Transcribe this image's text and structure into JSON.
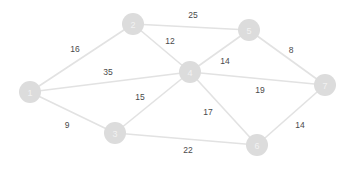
{
  "diagram": {
    "background_color": "#ffffff",
    "node_color": "#dcdcdc",
    "node_label_color": "#f2f2f2",
    "edge_color": "#e2e2e2",
    "weight_label_color": "#4a4a4a",
    "node_radius": 11
  },
  "chart_data": {
    "type": "diagram",
    "nodes": [
      {
        "id": "1",
        "label": "1",
        "x": 30,
        "y": 92
      },
      {
        "id": "2",
        "label": "2",
        "x": 133,
        "y": 24
      },
      {
        "id": "3",
        "label": "3",
        "x": 115,
        "y": 133
      },
      {
        "id": "4",
        "label": "4",
        "x": 190,
        "y": 72
      },
      {
        "id": "5",
        "label": "5",
        "x": 249,
        "y": 30
      },
      {
        "id": "6",
        "label": "6",
        "x": 257,
        "y": 145
      },
      {
        "id": "7",
        "label": "7",
        "x": 325,
        "y": 85
      }
    ],
    "edges": [
      {
        "source": "1",
        "target": "2",
        "weight": 16,
        "label_x": 75,
        "label_y": 49
      },
      {
        "source": "1",
        "target": "4",
        "weight": 35,
        "label_x": 108,
        "label_y": 72
      },
      {
        "source": "1",
        "target": "3",
        "weight": 9,
        "label_x": 67,
        "label_y": 125
      },
      {
        "source": "2",
        "target": "5",
        "weight": 25,
        "label_x": 193,
        "label_y": 15
      },
      {
        "source": "2",
        "target": "4",
        "weight": 12,
        "label_x": 170,
        "label_y": 41
      },
      {
        "source": "3",
        "target": "4",
        "weight": 15,
        "label_x": 140,
        "label_y": 97
      },
      {
        "source": "3",
        "target": "6",
        "weight": 22,
        "label_x": 188,
        "label_y": 150
      },
      {
        "source": "4",
        "target": "5",
        "weight": 14,
        "label_x": 225,
        "label_y": 61
      },
      {
        "source": "4",
        "target": "7",
        "weight": 19,
        "label_x": 260,
        "label_y": 90
      },
      {
        "source": "4",
        "target": "6",
        "weight": 17,
        "label_x": 208,
        "label_y": 112
      },
      {
        "source": "5",
        "target": "7",
        "weight": 8,
        "label_x": 291,
        "label_y": 50
      },
      {
        "source": "6",
        "target": "7",
        "weight": 14,
        "label_x": 300,
        "label_y": 125
      }
    ]
  }
}
